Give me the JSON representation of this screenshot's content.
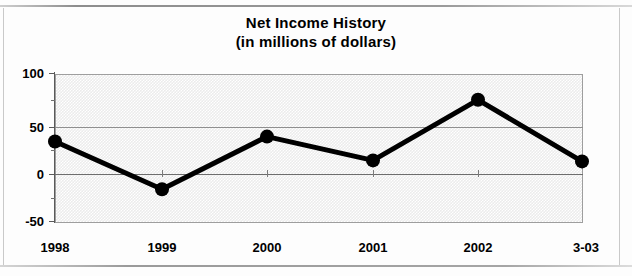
{
  "chart_data": {
    "type": "line",
    "title": "Net Income History",
    "subtitle": "(in millions of dollars)",
    "xlabel": "",
    "ylabel": "",
    "categories": [
      "1998",
      "1999",
      "2000",
      "2001",
      "2002",
      "3-03"
    ],
    "values": [
      30,
      -18,
      35,
      11,
      72,
      10
    ],
    "series": [
      {
        "name": "Net Income",
        "values": [
          30,
          -18,
          35,
          11,
          72,
          10
        ]
      }
    ],
    "ylim": [
      -50,
      100
    ],
    "yticks": [
      100,
      50,
      0,
      -50
    ],
    "ytick_labels": [
      "100",
      "50",
      "0",
      "-50"
    ],
    "yticks_minor": [
      75,
      25,
      -25
    ],
    "grid": true,
    "legend": false,
    "legend_position": "none",
    "marker": "filled-circle",
    "line_color": "#000000",
    "marker_color": "#000000",
    "plot_background": "#ececec"
  },
  "title": {
    "line1": "Net Income History",
    "line2": "(in millions of dollars)"
  },
  "axes": {
    "y": {
      "labels": [
        "100",
        "50",
        "0",
        "-50"
      ]
    },
    "x": {
      "labels": [
        "1998",
        "1999",
        "2000",
        "2001",
        "2002",
        "3-03"
      ]
    }
  }
}
